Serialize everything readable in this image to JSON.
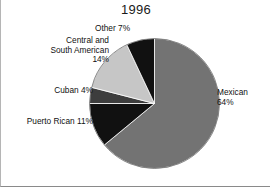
{
  "figure": {
    "title": "1996",
    "background_color": "#ffffff",
    "border_color": "#8a8a8a"
  },
  "labels": {
    "other": "Other 7%",
    "central_south_american": "Central and\nSouth American\n14%",
    "cuban": "Cuban 4%",
    "puerto_rican": "Puerto Rican 11%",
    "mexican": "Mexican\n64%"
  },
  "chart_data": {
    "type": "pie",
    "title": "1996",
    "xlabel": "",
    "ylabel": "",
    "legend": "none",
    "grid": false,
    "start_angle_deg": 90,
    "direction": "clockwise",
    "categories": [
      "Mexican",
      "Puerto Rican",
      "Cuban",
      "Central and South American",
      "Other"
    ],
    "values": [
      64,
      11,
      4,
      14,
      7
    ],
    "units": "percent",
    "slices": [
      {
        "label": "Mexican",
        "value": 64,
        "value_text": "64%",
        "color": "#737373",
        "label_text": "Mexican\n64%",
        "label_position": "right"
      },
      {
        "label": "Puerto Rican",
        "value": 11,
        "value_text": "11%",
        "color": "#111111",
        "label_text": "Puerto Rican 11%",
        "label_position": "lower-left"
      },
      {
        "label": "Cuban",
        "value": 4,
        "value_text": "4%",
        "color": "#3d3d3d",
        "label_text": "Cuban 4%",
        "label_position": "left"
      },
      {
        "label": "Central and South American",
        "value": 14,
        "value_text": "14%",
        "color": "#c6c6c6",
        "label_text": "Central and\nSouth American\n14%",
        "label_position": "upper-left"
      },
      {
        "label": "Other",
        "value": 7,
        "value_text": "7%",
        "color": "#111111",
        "label_position": "top"
      }
    ]
  }
}
